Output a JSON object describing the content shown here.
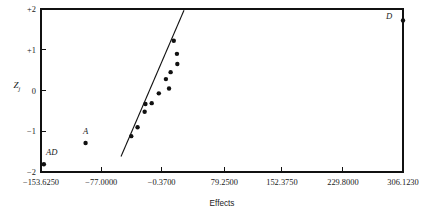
{
  "chart_data": {
    "type": "scatter",
    "title": "",
    "xlabel": "Effects",
    "ylabel": "Z j",
    "ylabel_main": "Z",
    "ylabel_sub": "j",
    "xlim": [
      -153.625,
      306.123
    ],
    "ylim": [
      -2,
      2
    ],
    "grid": false,
    "legend": null,
    "xticks": [
      -153.625,
      -77.0,
      -0.37,
      79.25,
      152.375,
      229.8,
      306.123
    ],
    "xtick_labels": [
      "−153.6250",
      "−77.0000",
      "−0.3700",
      "79.2500",
      "152.3750",
      "229.8000",
      "306.1230"
    ],
    "yticks": [
      2,
      1,
      0,
      -1,
      -2
    ],
    "ytick_labels": [
      "+2",
      "+1",
      "0",
      "−1",
      "−2"
    ],
    "points": [
      {
        "x": 306.123,
        "y": 1.72,
        "label": "D",
        "label_dx": -14,
        "label_dy": -1
      },
      {
        "x": 15.0,
        "y": 1.22,
        "label": "",
        "label_dx": 0,
        "label_dy": 0
      },
      {
        "x": 19.0,
        "y": 0.9,
        "label": "",
        "label_dx": 0,
        "label_dy": 0
      },
      {
        "x": 19.5,
        "y": 0.65,
        "label": "",
        "label_dx": 0,
        "label_dy": 0
      },
      {
        "x": 11.0,
        "y": 0.45,
        "label": "",
        "label_dx": 0,
        "label_dy": 0
      },
      {
        "x": 5.0,
        "y": 0.28,
        "label": "",
        "label_dx": 0,
        "label_dy": 0
      },
      {
        "x": 9.0,
        "y": 0.05,
        "label": "",
        "label_dx": 0,
        "label_dy": 0
      },
      {
        "x": -4.0,
        "y": -0.07,
        "label": "",
        "label_dx": 0,
        "label_dy": 0
      },
      {
        "x": -13.0,
        "y": -0.31,
        "label": "",
        "label_dx": 0,
        "label_dy": 0
      },
      {
        "x": -21.0,
        "y": -0.33,
        "label": "",
        "label_dx": 0,
        "label_dy": 0
      },
      {
        "x": -22.0,
        "y": -0.52,
        "label": "",
        "label_dx": 0,
        "label_dy": 0
      },
      {
        "x": -31.0,
        "y": -0.9,
        "label": "",
        "label_dx": 0,
        "label_dy": 0
      },
      {
        "x": -39.0,
        "y": -1.12,
        "label": "",
        "label_dx": 0,
        "label_dy": 0
      },
      {
        "x": -97.0,
        "y": -1.29,
        "label": "A",
        "label_dx": 0,
        "label_dy": -9
      },
      {
        "x": -150.0,
        "y": -1.81,
        "label": "AD",
        "label_dx": 8,
        "label_dy": -9
      }
    ],
    "fit_line": {
      "x1": -52.0,
      "y1": -1.62,
      "x2": 28.0,
      "y2": 1.97
    },
    "point_radius": 2.2
  },
  "figure": {
    "width": 429,
    "height": 217,
    "plot_left": 41,
    "plot_right": 403,
    "plot_top": 9,
    "plot_bottom": 172,
    "background": "#ffffff",
    "ink": "#111111"
  }
}
